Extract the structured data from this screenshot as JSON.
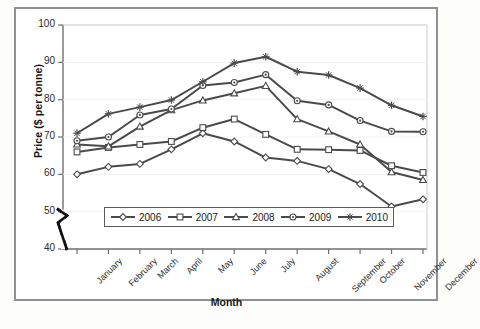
{
  "chart_data": {
    "type": "line",
    "title": "",
    "xlabel": "Month",
    "ylabel": "Price ($ per tonne)",
    "ylim": [
      40,
      100
    ],
    "yticks": [
      40,
      50,
      60,
      70,
      80,
      90,
      100
    ],
    "axis_break": {
      "between": [
        40,
        50
      ],
      "symbol": "zigzag"
    },
    "grid": false,
    "legend_position": "inside-bottom-center",
    "categories": [
      "January",
      "February",
      "March",
      "April",
      "May",
      "June",
      "July",
      "August",
      "September",
      "October",
      "November",
      "December"
    ],
    "series": [
      {
        "name": "2006",
        "marker": "diamond",
        "color": "#4a4a4a",
        "values": [
          60.0,
          62.0,
          62.8,
          66.7,
          71.0,
          68.8,
          64.5,
          63.6,
          61.4,
          57.4,
          51.4,
          53.3
        ]
      },
      {
        "name": "2007",
        "marker": "square",
        "color": "#4a4a4a",
        "values": [
          66.0,
          67.2,
          68.0,
          68.8,
          72.5,
          74.8,
          70.7,
          66.7,
          66.6,
          66.4,
          62.3,
          60.5
        ]
      },
      {
        "name": "2008",
        "marker": "triangle",
        "color": "#4a4a4a",
        "values": [
          68.0,
          67.5,
          72.8,
          77.2,
          79.8,
          81.7,
          83.7,
          74.8,
          71.5,
          68.0,
          60.6,
          58.5
        ]
      },
      {
        "name": "2009",
        "marker": "circle",
        "color": "#4a4a4a",
        "values": [
          69.0,
          70.0,
          75.9,
          77.5,
          83.8,
          84.6,
          86.7,
          79.7,
          78.6,
          74.4,
          71.5,
          71.4
        ]
      },
      {
        "name": "2010",
        "marker": "star",
        "color": "#4a4a4a",
        "values": [
          71.0,
          76.2,
          78.0,
          79.9,
          84.8,
          89.8,
          91.5,
          87.5,
          86.6,
          83.1,
          78.5,
          75.5
        ]
      }
    ]
  },
  "legend": {
    "entries": [
      "2006",
      "2007",
      "2008",
      "2009",
      "2010"
    ]
  },
  "axis": {
    "y_title": "Price ($ per tonne)",
    "x_title": "Month",
    "y_tick_labels": [
      "100",
      "90",
      "80",
      "70",
      "60",
      "50",
      "40"
    ],
    "x_tick_labels": [
      "January",
      "February",
      "March",
      "April",
      "May",
      "June",
      "July",
      "August",
      "September",
      "October",
      "November",
      "December"
    ]
  }
}
